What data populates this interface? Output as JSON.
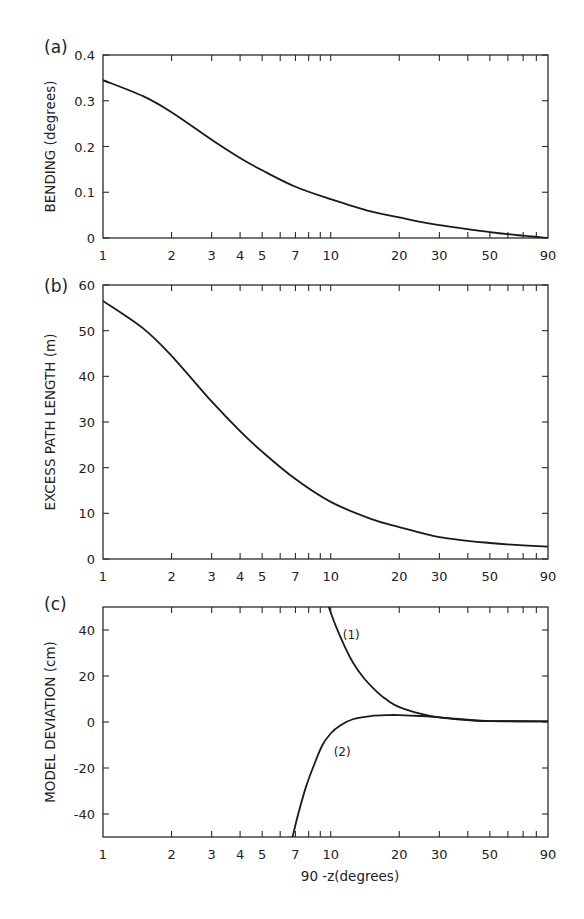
{
  "figure": {
    "xlabel": "90 -z(degrees)"
  },
  "chart_data": [
    {
      "panel": "(a)",
      "type": "line",
      "title": "",
      "xlabel": "",
      "ylabel": "BENDING (degrees)",
      "xscale": "log",
      "xlim": [
        1,
        90
      ],
      "ylim": [
        0,
        0.4
      ],
      "xticks": [
        1,
        2,
        3,
        4,
        5,
        7,
        10,
        20,
        30,
        50,
        90
      ],
      "xtick_labels": [
        "1",
        "2",
        "3",
        "4",
        "5",
        "7",
        "10",
        "20",
        "30",
        "50",
        "90"
      ],
      "yticks": [
        0,
        0.1,
        0.2,
        0.3,
        0.4
      ],
      "ytick_labels": [
        "0",
        "0.1",
        "0.2",
        "0.3",
        "0.4"
      ],
      "grid": false,
      "series": [
        {
          "name": "bending",
          "x": [
            1,
            1.5,
            2,
            3,
            4,
            5,
            7,
            10,
            15,
            20,
            30,
            50,
            70,
            90
          ],
          "y": [
            0.345,
            0.31,
            0.275,
            0.215,
            0.175,
            0.148,
            0.112,
            0.085,
            0.058,
            0.045,
            0.028,
            0.013,
            0.005,
            0.0
          ]
        }
      ]
    },
    {
      "panel": "(b)",
      "type": "line",
      "title": "",
      "xlabel": "",
      "ylabel": "EXCESS PATH LENGTH (m)",
      "xscale": "log",
      "xlim": [
        1,
        90
      ],
      "ylim": [
        0,
        60
      ],
      "xticks": [
        1,
        2,
        3,
        4,
        5,
        7,
        10,
        20,
        30,
        50,
        90
      ],
      "xtick_labels": [
        "1",
        "2",
        "3",
        "4",
        "5",
        "7",
        "10",
        "20",
        "30",
        "50",
        "90"
      ],
      "yticks": [
        0,
        10,
        20,
        30,
        40,
        50,
        60
      ],
      "ytick_labels": [
        "0",
        "10",
        "20",
        "30",
        "40",
        "50",
        "60"
      ],
      "grid": false,
      "series": [
        {
          "name": "excess path length",
          "x": [
            1,
            1.5,
            2,
            3,
            4,
            5,
            7,
            10,
            15,
            20,
            30,
            50,
            70,
            90
          ],
          "y": [
            56.5,
            50.5,
            44.5,
            34.5,
            28.0,
            23.5,
            17.5,
            12.5,
            8.8,
            7.0,
            4.8,
            3.5,
            3.0,
            2.7
          ]
        }
      ]
    },
    {
      "panel": "(c)",
      "type": "line",
      "title": "",
      "xlabel": "90 -z(degrees)",
      "ylabel": "MODEL DEVIATION (cm)",
      "xscale": "log",
      "xlim": [
        1,
        90
      ],
      "ylim": [
        -50,
        50
      ],
      "xticks": [
        1,
        2,
        3,
        4,
        5,
        7,
        10,
        20,
        30,
        50,
        90
      ],
      "xtick_labels": [
        "1",
        "2",
        "3",
        "4",
        "5",
        "7",
        "10",
        "20",
        "30",
        "50",
        "90"
      ],
      "yticks": [
        -40,
        -20,
        0,
        20,
        40
      ],
      "ytick_labels": [
        "-40",
        "-20",
        "0",
        "20",
        "40"
      ],
      "grid": false,
      "series": [
        {
          "name": "(1)",
          "x": [
            9.8,
            10.5,
            11.5,
            12.5,
            14,
            16,
            18,
            20,
            25,
            30,
            40,
            50,
            90
          ],
          "y": [
            50,
            42,
            33,
            26,
            19,
            13,
            9,
            6.5,
            3.5,
            2.0,
            0.8,
            0.4,
            0.3
          ],
          "label_at": [
            11.3,
            38
          ]
        },
        {
          "name": "(2)",
          "x": [
            6.8,
            7.2,
            7.8,
            8.5,
            9.2,
            10,
            11,
            12.5,
            15,
            18,
            20,
            25,
            30,
            40,
            50,
            90
          ],
          "y": [
            -50,
            -40,
            -28,
            -18,
            -10,
            -5,
            -1.5,
            1.2,
            2.6,
            3.0,
            3.0,
            2.6,
            2.0,
            1.0,
            0.4,
            0.3
          ],
          "label_at": [
            10.3,
            -13
          ]
        }
      ]
    }
  ]
}
